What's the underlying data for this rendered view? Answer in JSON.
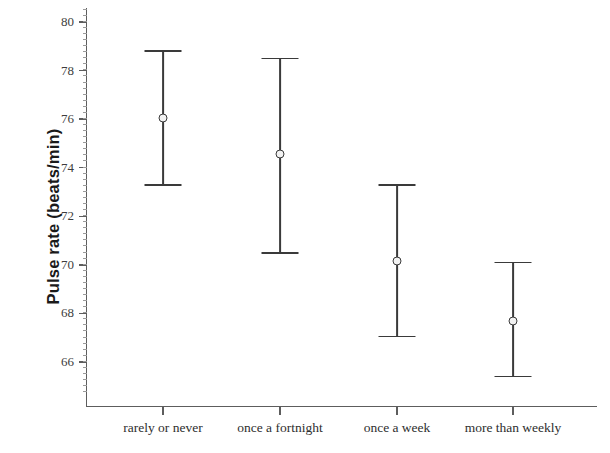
{
  "chart_data": {
    "type": "scatter",
    "title": "",
    "subtitle": "",
    "xlabel": "",
    "ylabel": "Pulse rate (beats/min)",
    "categories": [
      "rarely or never",
      "once a fortnight",
      "once a week",
      "more than weekly"
    ],
    "series": [
      {
        "name": "Mean pulse rate",
        "values": [
          76.05,
          74.55,
          70.15,
          67.7
        ],
        "error_upper": [
          78.8,
          78.5,
          73.3,
          70.1
        ],
        "error_lower": [
          73.3,
          70.5,
          67.05,
          65.4
        ]
      }
    ],
    "ylim": [
      64.8,
      80.7
    ],
    "yticks": [
      66,
      68,
      70,
      72,
      74,
      76,
      78,
      80
    ],
    "ytick_labels": [
      "66",
      "68",
      "70",
      "72",
      "74",
      "76",
      "78",
      "80"
    ],
    "minor_tick_interval": 0.25,
    "grid": false,
    "legend": "none",
    "marker": "open-circle",
    "errorbar_style": "capped-vertical",
    "colors": {
      "line": "#3a3a3a",
      "marker_face": "#f2f2f2",
      "axis": "#5d5d5d",
      "tick_label": "#3d3d3d",
      "axis_title": "#1a1a1a",
      "background": "#ffffff"
    }
  },
  "axis": {
    "y_title": "Pulse rate (beats/min)"
  }
}
